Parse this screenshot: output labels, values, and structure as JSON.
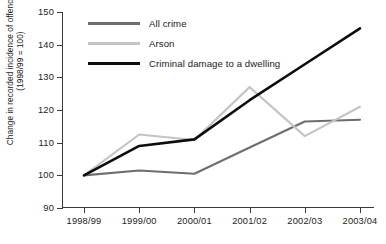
{
  "chart_data": {
    "type": "line",
    "title": "",
    "xlabel": "",
    "ylabel_line1": "Change in recorded incidence of offence type",
    "ylabel_line2": "(1998/99 = 100)",
    "categories": [
      "1998/99",
      "1999/00",
      "2000/01",
      "2001/02",
      "2002/03",
      "2003/04"
    ],
    "ylim": [
      90,
      150
    ],
    "yticks": [
      90,
      100,
      110,
      120,
      130,
      140,
      150
    ],
    "grid": false,
    "legend_position": "top-left-inside",
    "series": [
      {
        "name": "All crime",
        "color": "#6e6e6e",
        "values": [
          100,
          101.5,
          100.5,
          108.5,
          116.5,
          117
        ]
      },
      {
        "name": "Arson",
        "color": "#c4c4c4",
        "values": [
          100,
          112.5,
          110.8,
          127,
          112,
          121
        ]
      },
      {
        "name": "Criminal damage to a dwelling",
        "color": "#0d0d0d",
        "values": [
          100,
          109,
          111,
          123,
          134,
          145
        ]
      }
    ]
  },
  "axis": {
    "line_color": "#3a3a3a"
  }
}
